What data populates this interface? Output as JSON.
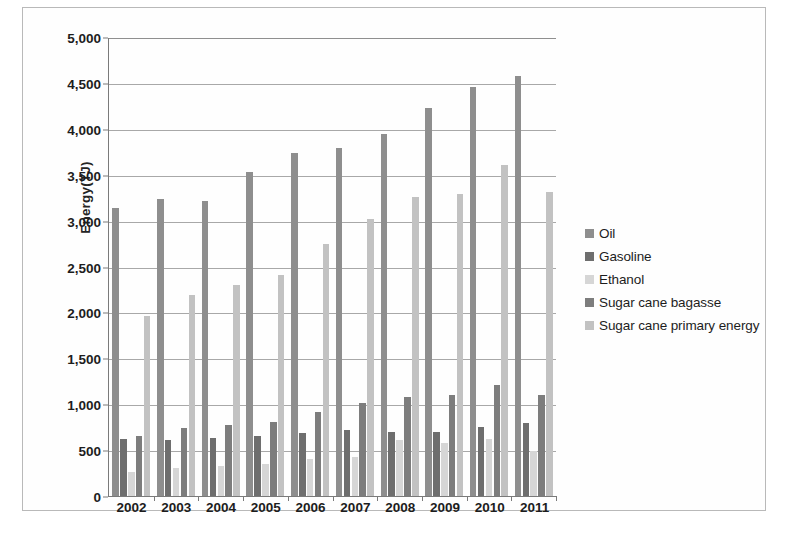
{
  "figure": {
    "background": "#ffffff",
    "border_color": "#b9b9b9"
  },
  "axis": {
    "ylabel": "Energy(TJ)",
    "xlabel": "",
    "yticks": [
      "0",
      "500",
      "1,000",
      "1,500",
      "2,000",
      "2,500",
      "3,000",
      "3,500",
      "4,000",
      "4,500",
      "5,000"
    ]
  },
  "legend": {
    "position": "right",
    "items": [
      {
        "label": "Oil",
        "color": "#8e8e8e"
      },
      {
        "label": "Gasoline",
        "color": "#6e6e6e"
      },
      {
        "label": "Ethanol",
        "color": "#d6d6d6"
      },
      {
        "label": "Sugar cane bagasse",
        "color": "#7d7d7d"
      },
      {
        "label": "Sugar cane primary energy",
        "color": "#c2c2c2"
      }
    ]
  },
  "caption": "",
  "chart_data": {
    "type": "bar",
    "title": "",
    "xlabel": "",
    "ylabel": "Energy(TJ)",
    "ylim": [
      0,
      5000
    ],
    "ytick_step": 500,
    "grid": true,
    "legend_position": "right",
    "categories": [
      "2002",
      "2003",
      "2004",
      "2005",
      "2006",
      "2007",
      "2008",
      "2009",
      "2010",
      "2011"
    ],
    "series": [
      {
        "name": "Oil",
        "color": "#8e8e8e",
        "values": [
          3140,
          3240,
          3210,
          3530,
          3740,
          3790,
          3940,
          4230,
          4460,
          4570
        ]
      },
      {
        "name": "Gasoline",
        "color": "#6e6e6e",
        "values": [
          620,
          610,
          630,
          650,
          690,
          720,
          700,
          700,
          750,
          800
        ]
      },
      {
        "name": "Ethanol",
        "color": "#d6d6d6",
        "values": [
          260,
          310,
          330,
          350,
          400,
          430,
          610,
          580,
          620,
          490
        ]
      },
      {
        "name": "Sugar cane bagasse",
        "color": "#7d7d7d",
        "values": [
          650,
          740,
          770,
          810,
          920,
          1010,
          1080,
          1100,
          1210,
          1100
        ]
      },
      {
        "name": "Sugar cane primary energy",
        "color": "#c2c2c2",
        "values": [
          1960,
          2190,
          2300,
          2410,
          2740,
          3020,
          3260,
          3290,
          3610,
          3310
        ]
      }
    ]
  }
}
